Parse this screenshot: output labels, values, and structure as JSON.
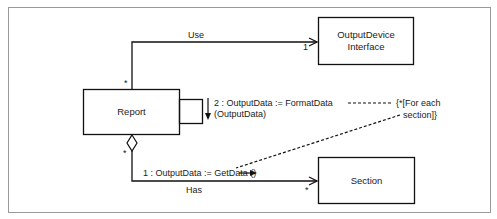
{
  "diagram": {
    "type": "UML collaboration diagram",
    "classes": [
      {
        "id": "report",
        "label": "Report"
      },
      {
        "id": "output_device",
        "label_line1": "OutputDevice",
        "label_line2": "Interface"
      },
      {
        "id": "section",
        "label": "Section"
      }
    ],
    "associations": [
      {
        "name": "Use",
        "from": "Report",
        "to": "OutputDevice Interface",
        "from_multiplicity": "*",
        "to_multiplicity": "1",
        "navigable": "to"
      },
      {
        "name": "Has",
        "from": "Report",
        "to": "Section",
        "from_multiplicity": "*",
        "to_multiplicity": "*",
        "aggregation": "from",
        "navigable": "to"
      }
    ],
    "messages": [
      {
        "seq_line1": "2 : OutputData := FormatData",
        "seq_line2": "(OutputData)",
        "kind": "self"
      },
      {
        "text": "1 : OutputData := GetData ()",
        "kind": "to-section"
      }
    ],
    "note": {
      "line1": "{*[For each",
      "line2": "section]}"
    },
    "colors": {
      "line": "#111111",
      "frame": "#9a9a9a",
      "background": "#ffffff"
    }
  }
}
